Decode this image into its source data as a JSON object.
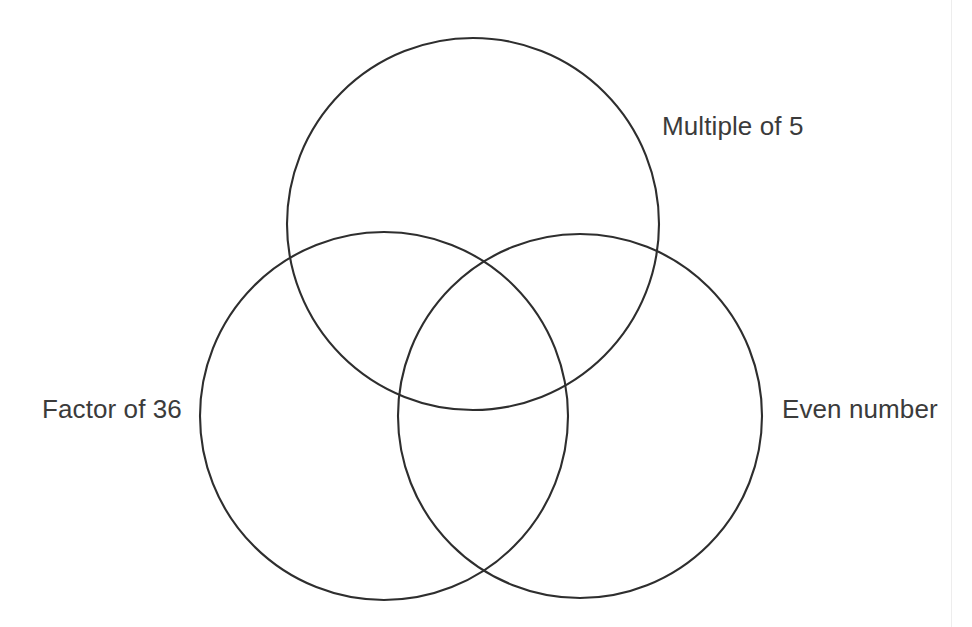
{
  "page": {
    "background_color": "#ffffff",
    "width": 972,
    "height": 627,
    "divider_color": "#ededed"
  },
  "diagram": {
    "type": "venn",
    "set_count": 3,
    "stroke_color": "#2e2e2e",
    "stroke_width": 2.1,
    "fill": "none",
    "label_color": "#3b3b3b",
    "circles": [
      {
        "id": "multiple-of-5",
        "label": "Multiple of 5",
        "cx": 473,
        "cy": 224,
        "r": 186,
        "position": "top"
      },
      {
        "id": "factor-of-36",
        "label": "Factor of 36",
        "cx": 384,
        "cy": 416,
        "r": 184,
        "position": "bottom-left"
      },
      {
        "id": "even-number",
        "label": "Even number",
        "cx": 580,
        "cy": 416,
        "r": 182,
        "position": "bottom-right"
      }
    ],
    "labels": {
      "top_right": "Multiple of 5",
      "left": "Factor of 36",
      "right": "Even number"
    },
    "regions": {
      "note": "All seven regions of the Venn diagram are empty (no numbers placed)."
    }
  }
}
